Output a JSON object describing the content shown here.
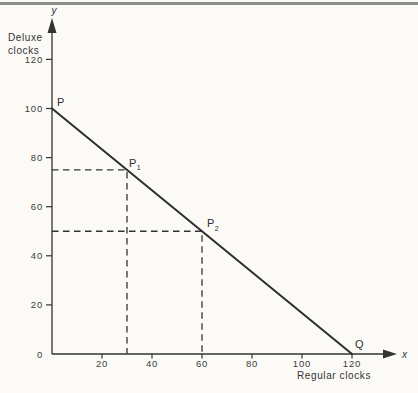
{
  "figure": {
    "background": "#fbfaf6",
    "rule_color": "#8d8d8d",
    "ink_color": "#333333",
    "line_color": "#2e2e2e"
  },
  "chart_data": {
    "type": "line",
    "title": "",
    "xlabel": "Regular clocks",
    "ylabel": "Deluxe clocks",
    "ylabel_lines": [
      "Deluxe",
      "clocks"
    ],
    "x_axis_letter": "x",
    "y_axis_letter": "y",
    "xlim": [
      0,
      132
    ],
    "ylim": [
      0,
      132
    ],
    "x_ticks": [
      20,
      40,
      60,
      80,
      100,
      120
    ],
    "y_ticks": [
      0,
      20,
      40,
      60,
      80,
      100,
      120
    ],
    "grid": false,
    "legend": false,
    "series": [
      {
        "name": "PQ",
        "x": [
          0,
          120
        ],
        "y": [
          100,
          0
        ]
      }
    ],
    "points": [
      {
        "label": "P",
        "sub": "",
        "x": 0,
        "y": 100,
        "guides": false
      },
      {
        "label": "P",
        "sub": "1",
        "x": 30,
        "y": 75,
        "guides": true
      },
      {
        "label": "P",
        "sub": "2",
        "x": 60,
        "y": 50,
        "guides": true
      },
      {
        "label": "Q",
        "sub": "",
        "x": 120,
        "y": 0,
        "guides": false
      }
    ]
  }
}
